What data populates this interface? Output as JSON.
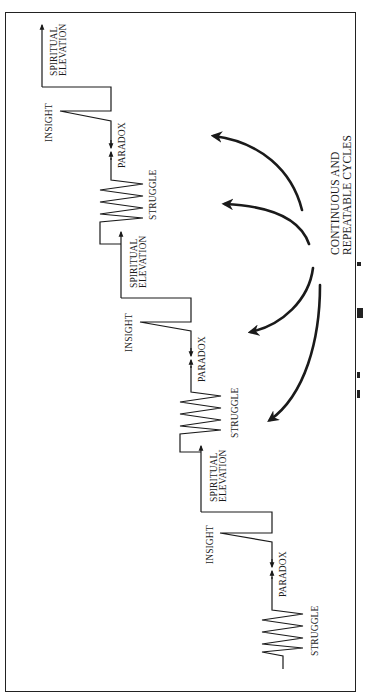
{
  "diagram": {
    "orientation": "rotated 90 degrees clockwise (read bottom-to-top)",
    "cycles": [
      {
        "labels": {
          "struggle": "STRUGGLE",
          "paradox": "PARADOX",
          "insight": "INSIGHT",
          "elevation_line1": "SPIRITUAL",
          "elevation_line2": "ELEVATION"
        }
      },
      {
        "labels": {
          "struggle": "STRUGGLE",
          "paradox": "PARADOX",
          "insight": "INSIGHT",
          "elevation_line1": "SPIRITUAL",
          "elevation_line2": "ELEVATION"
        }
      },
      {
        "labels": {
          "struggle": "STRUGGLE",
          "paradox": "PARADOX",
          "insight": "INSIGHT",
          "elevation_line1": "SPIRITUAL",
          "elevation_line2": "ELEVATION"
        }
      }
    ],
    "callout": {
      "line1": "CONTINUOUS AND",
      "line2": "REPEATABLE CYCLES",
      "arrow_count": 4
    },
    "colors": {
      "ink": "#1a1a1a",
      "background": "#ffffff"
    }
  }
}
